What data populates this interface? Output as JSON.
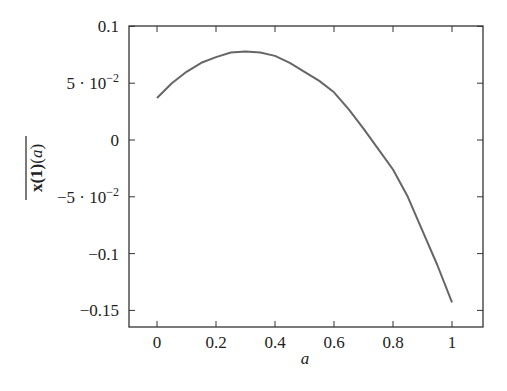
{
  "chart_data": {
    "type": "line",
    "title": "",
    "xlabel": "a",
    "ylabel": "x(1)(a) (overlined)",
    "xlim": [
      -0.1,
      1.1
    ],
    "ylim": [
      -0.16,
      0.1
    ],
    "grid": false,
    "legend": null,
    "x_ticks": [
      0,
      0.2,
      0.4,
      0.6,
      0.8,
      1
    ],
    "x_tick_labels": [
      "0",
      "0.2",
      "0.4",
      "0.6",
      "0.8",
      "1"
    ],
    "y_ticks": [
      0.1,
      0.05,
      0,
      -0.05,
      -0.1,
      -0.15
    ],
    "y_tick_labels": [
      "0.1",
      "5 · 10^-2",
      "0",
      "-5 · 10^-2",
      "-0.1",
      "-0.15"
    ],
    "series": [
      {
        "name": "x(1)(a)",
        "color": "#666666",
        "x": [
          0,
          0.05,
          0.1,
          0.15,
          0.2,
          0.25,
          0.3,
          0.35,
          0.4,
          0.45,
          0.5,
          0.55,
          0.6,
          0.65,
          0.7,
          0.75,
          0.8,
          0.85,
          0.9,
          0.95,
          1.0
        ],
        "y": [
          0.037,
          0.05,
          0.06,
          0.068,
          0.073,
          0.077,
          0.078,
          0.077,
          0.074,
          0.068,
          0.06,
          0.052,
          0.042,
          0.027,
          0.01,
          -0.008,
          -0.026,
          -0.05,
          -0.08,
          -0.11,
          -0.143
        ]
      }
    ]
  }
}
